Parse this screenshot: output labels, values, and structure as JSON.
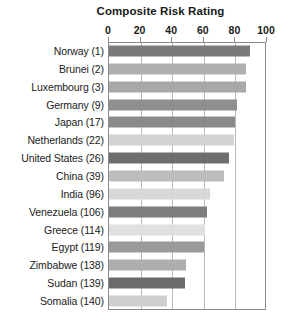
{
  "chart_data": {
    "type": "bar",
    "orientation": "horizontal",
    "title": "Composite Risk Rating",
    "xlabel": "",
    "ylabel": "",
    "xlim": [
      0,
      100
    ],
    "xticks": [
      0,
      20,
      40,
      60,
      80,
      100
    ],
    "grid": true,
    "legend": "none",
    "categories": [
      "Norway (1)",
      "Brunei (2)",
      "Luxembourg (3)",
      "Germany (9)",
      "Japan (17)",
      "Netherlands (22)",
      "United States (26)",
      "China (39)",
      "India (96)",
      "Venezuela (106)",
      "Greece (114)",
      "Egypt (119)",
      "Zimbabwe (138)",
      "Sudan (139)",
      "Somalia (140)"
    ],
    "values": [
      89,
      87,
      87,
      81,
      80,
      79,
      76,
      73,
      64,
      62,
      61,
      60,
      49,
      48,
      37
    ],
    "bar_colors": [
      "#7a7a7a",
      "#b0b0b0",
      "#a8a8a8",
      "#8f8f8f",
      "#8a8a8a",
      "#d2d2d2",
      "#6e6e6e",
      "#bdbdbd",
      "#d8d8d8",
      "#7d7d7d",
      "#e0e0e0",
      "#9a9a9a",
      "#aeaeae",
      "#6b6b6b",
      "#cfcfcf"
    ]
  },
  "colors": {
    "background": "#ffffff",
    "frame": "#8b8b8b",
    "gridline": "#b9b9b9",
    "text": "#1a1a1a"
  }
}
